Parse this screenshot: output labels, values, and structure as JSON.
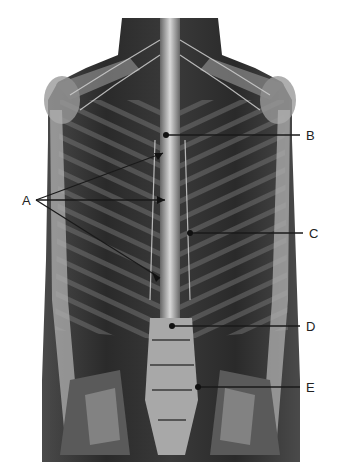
{
  "figure": {
    "colors": {
      "background": "#ffffff",
      "line": "#1a1a1a",
      "label": "#222222",
      "tissue_dark": "#2b2b2b",
      "tissue_mid": "#6a6a6a",
      "tissue_light": "#bdbdbd"
    }
  },
  "labels": [
    {
      "id": "A",
      "text": "A",
      "x": 22,
      "y": 194,
      "targets": [
        [
          163,
          153
        ],
        [
          165,
          200
        ],
        [
          160,
          278
        ]
      ]
    },
    {
      "id": "B",
      "text": "B",
      "x": 306,
      "y": 129,
      "targets": [
        [
          166,
          135
        ]
      ]
    },
    {
      "id": "C",
      "text": "C",
      "x": 309,
      "y": 228,
      "targets": [
        [
          190,
          233
        ]
      ]
    },
    {
      "id": "D",
      "text": "D",
      "x": 306,
      "y": 320,
      "targets": [
        [
          172,
          326
        ]
      ]
    },
    {
      "id": "E",
      "text": "E",
      "x": 306,
      "y": 382,
      "targets": [
        [
          198,
          387
        ]
      ]
    }
  ]
}
